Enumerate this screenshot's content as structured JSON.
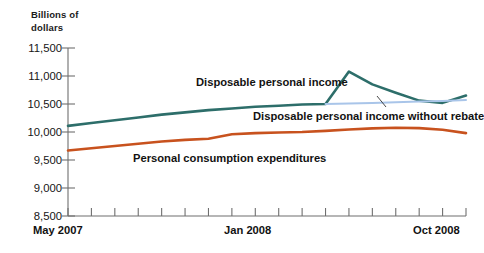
{
  "chart_data": {
    "type": "line",
    "title": "",
    "subtitle": "",
    "ylabel_line1": "Billions of",
    "ylabel_line2": "dollars",
    "xlabel": "",
    "ylim": [
      8500,
      11500
    ],
    "yticks": [
      8500,
      9000,
      9500,
      10000,
      10500,
      11000,
      11500
    ],
    "ytick_labels": [
      "8,500",
      "9,000",
      "9,500",
      "10,000",
      "10,500",
      "11,000",
      "11,500"
    ],
    "grid": false,
    "legend_position": "inline-annotations",
    "x": [
      "May 2007",
      "Jun 2007",
      "Jul 2007",
      "Aug 2007",
      "Sep 2007",
      "Oct 2007",
      "Nov 2007",
      "Dec 2007",
      "Jan 2008",
      "Feb 2008",
      "Mar 2008",
      "Apr 2008",
      "May 2008",
      "Jun 2008",
      "Jul 2008",
      "Aug 2008",
      "Sep 2008",
      "Oct 2008"
    ],
    "xtick_labels": [
      "May 2007",
      "Jan 2008",
      "Oct 2008"
    ],
    "xtick_label_positions": [
      0,
      8,
      17
    ],
    "series": [
      {
        "name": "Disposable personal income",
        "color": "#2d6e6a",
        "values": [
          10110,
          10160,
          10210,
          10260,
          10310,
          10350,
          10390,
          10420,
          10450,
          10470,
          10490,
          10500,
          11080,
          10850,
          10700,
          10560,
          10520,
          10650
        ]
      },
      {
        "name": "Disposable personal income without rebate",
        "color": "#a9c5e9",
        "values": [
          null,
          null,
          null,
          null,
          null,
          null,
          null,
          null,
          null,
          null,
          null,
          10500,
          10510,
          10520,
          10530,
          10545,
          10555,
          10570
        ]
      },
      {
        "name": "Personal consumption expenditures",
        "color": "#c8521e",
        "values": [
          9670,
          9710,
          9750,
          9790,
          9830,
          9860,
          9880,
          9960,
          9980,
          9990,
          10000,
          10020,
          10045,
          10065,
          10075,
          10070,
          10040,
          9980
        ]
      }
    ],
    "annotations": [
      {
        "name": "disposable-personal-income",
        "text": "Disposable personal income"
      },
      {
        "name": "disposable-personal-income-without-rebate",
        "text": "Disposable personal income without rebate"
      },
      {
        "name": "personal-consumption-expenditures",
        "text": "Personal consumption expenditures"
      }
    ]
  },
  "axis": {
    "title_line1": "Billions of",
    "title_line2": "dollars",
    "y": {
      "t0": "8,500",
      "t1": "9,000",
      "t2": "9,500",
      "t3": "10,000",
      "t4": "10,500",
      "t5": "11,000",
      "t6": "11,500"
    },
    "x": {
      "start": "May 2007",
      "mid": "Jan 2008",
      "end": "Oct 2008"
    }
  },
  "labels": {
    "dpi": "Disposable personal income",
    "dpi_no_rebate": "Disposable personal income without rebate",
    "pce": "Personal consumption expenditures"
  },
  "colors": {
    "teal": "#2d6e6a",
    "light_blue": "#a9c5e9",
    "orange": "#c8521e",
    "axis": "#6f6f6f",
    "background": "#ffffff"
  }
}
